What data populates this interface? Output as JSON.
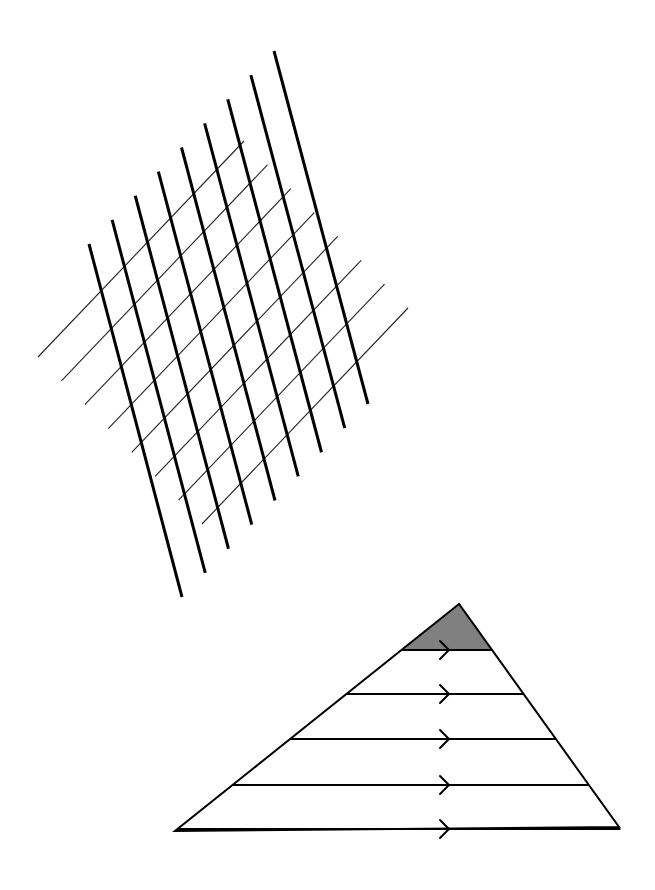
{
  "figure": {
    "colors": {
      "background": "#ffffff",
      "line": "#000000",
      "thin_line": "#222222",
      "shade": "#808080"
    }
  },
  "grid": {
    "thick_lines": {
      "count": 9,
      "first": {
        "x1": 89,
        "y1": 244,
        "x2": 182,
        "y2": 597
      },
      "last": {
        "x1": 274,
        "y1": 51,
        "x2": 368,
        "y2": 404
      }
    },
    "thin_lines": {
      "count": 8,
      "first": {
        "x1": 244,
        "y1": 141,
        "x2": 38,
        "y2": 357
      },
      "last": {
        "x1": 408,
        "y1": 308,
        "x2": 202,
        "y2": 524
      }
    }
  },
  "triangle": {
    "apex": {
      "x": 459,
      "y": 604
    },
    "base_left": {
      "x": 175,
      "y": 831
    },
    "base_right": {
      "x": 619,
      "y": 827
    },
    "parallel_lines_y": [
      650,
      694,
      739,
      785,
      829
    ],
    "arrow_x": 446,
    "arrow_count": 5,
    "shaded_region": "top-triangle"
  }
}
